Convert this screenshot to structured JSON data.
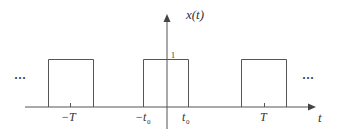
{
  "diagram": {
    "type": "periodic-rectangular-pulse-train",
    "y_axis_label": "x(t)",
    "x_axis_label": "t",
    "amplitude_label": "1",
    "ellipsis_left": "···",
    "ellipsis_right": "···",
    "tick_labels": {
      "neg_T": "−T",
      "neg_t0": "−t",
      "neg_t0_sub": "0",
      "t0": "t",
      "t0_sub": "0",
      "T": "T"
    },
    "colors": {
      "line": "#555555",
      "text": "#333333",
      "background": "#ffffff"
    },
    "pulses": [
      {
        "name": "pulse-left",
        "center": "-T"
      },
      {
        "name": "pulse-center",
        "center": "0"
      },
      {
        "name": "pulse-right",
        "center": "T"
      }
    ]
  }
}
